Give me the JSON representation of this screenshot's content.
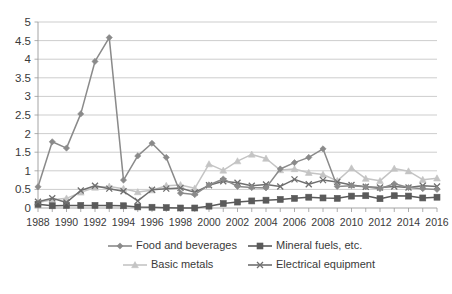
{
  "chart_data": {
    "type": "line",
    "title": "",
    "xlabel": "",
    "ylabel": "",
    "ylim": [
      0,
      5
    ],
    "ytick_step": 0.5,
    "grid": true,
    "legend_position": "bottom",
    "x": [
      1988,
      1989,
      1990,
      1991,
      1992,
      1993,
      1994,
      1995,
      1996,
      1997,
      1998,
      1999,
      2000,
      2001,
      2002,
      2003,
      2004,
      2005,
      2006,
      2007,
      2008,
      2009,
      2010,
      2011,
      2012,
      2013,
      2014,
      2015,
      2016
    ],
    "x_tick_labels": [
      "1988",
      "1990",
      "1992",
      "1994",
      "1996",
      "1998",
      "2000",
      "2002",
      "2004",
      "2006",
      "2008",
      "2010",
      "2012",
      "2014",
      "2016"
    ],
    "y_tick_labels": [
      "0",
      "0.5",
      "1",
      "1.5",
      "2",
      "2.5",
      "3",
      "3.5",
      "4",
      "4.5",
      "5"
    ],
    "series": [
      {
        "name": "Food and beverages",
        "color": "#8a8a8a",
        "marker": "diamond",
        "values": [
          0.57,
          1.78,
          1.61,
          2.53,
          3.94,
          4.58,
          0.75,
          1.4,
          1.74,
          1.36,
          0.4,
          0.36,
          0.62,
          0.78,
          0.58,
          0.55,
          0.54,
          1.05,
          1.22,
          1.36,
          1.59,
          0.58,
          0.6,
          0.57,
          0.52,
          0.65,
          0.55,
          0.52,
          0.5
        ]
      },
      {
        "name": "Mineral fuels, etc.",
        "color": "#5a5a5a",
        "marker": "square",
        "values": [
          0.1,
          0.06,
          0.07,
          0.07,
          0.07,
          0.07,
          0.06,
          0.03,
          0.02,
          0.01,
          0.0,
          0.0,
          0.05,
          0.12,
          0.16,
          0.19,
          0.21,
          0.23,
          0.26,
          0.29,
          0.27,
          0.26,
          0.32,
          0.33,
          0.25,
          0.33,
          0.32,
          0.27,
          0.29
        ]
      },
      {
        "name": "Basic metals",
        "color": "#c4c4c4",
        "marker": "triangle",
        "values": [
          0.15,
          0.22,
          0.26,
          0.42,
          0.55,
          0.58,
          0.52,
          0.43,
          0.48,
          0.6,
          0.62,
          0.53,
          1.18,
          1.01,
          1.26,
          1.44,
          1.33,
          1.02,
          1.05,
          0.95,
          0.9,
          0.73,
          1.07,
          0.79,
          0.73,
          1.06,
          0.99,
          0.76,
          0.8
        ]
      },
      {
        "name": "Electrical equipment",
        "color": "#6f6f6f",
        "marker": "x",
        "values": [
          0.17,
          0.26,
          0.15,
          0.47,
          0.6,
          0.52,
          0.45,
          0.19,
          0.49,
          0.52,
          0.54,
          0.42,
          0.61,
          0.72,
          0.68,
          0.6,
          0.63,
          0.58,
          0.77,
          0.64,
          0.75,
          0.7,
          0.62,
          0.57,
          0.55,
          0.58,
          0.55,
          0.6,
          0.58
        ]
      }
    ]
  },
  "plot": {
    "left": 38,
    "top": 22,
    "right": 437,
    "bottom": 208
  },
  "legend": {
    "rows": [
      [
        {
          "label": "Food and beverages",
          "series": 0,
          "x": 108,
          "y": 246
        },
        {
          "label": "Mineral fuels, etc.",
          "series": 1,
          "x": 248,
          "y": 246
        }
      ],
      [
        {
          "label": "Basic metals",
          "series": 2,
          "x": 123,
          "y": 265
        },
        {
          "label": "Electrical equipment",
          "series": 3,
          "x": 248,
          "y": 265
        }
      ]
    ]
  }
}
